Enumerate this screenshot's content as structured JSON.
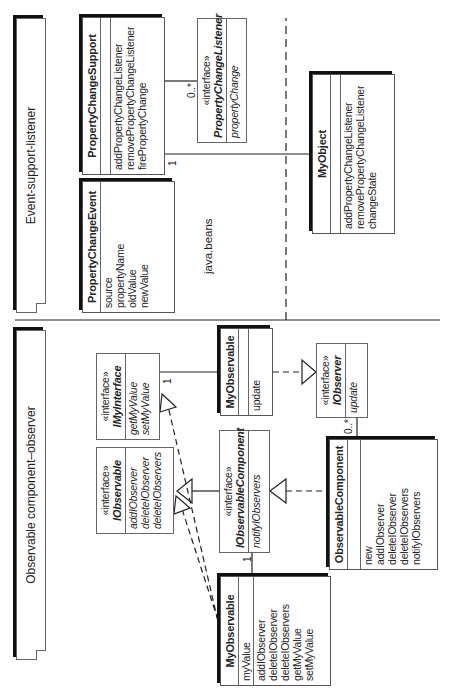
{
  "top_pattern": {
    "note_title": "Event-support-listener",
    "package_label": "java.beans",
    "classes": {
      "property_change_support": {
        "name": "PropertyChangeSupport",
        "attributes": [],
        "operations": [
          "addPropertyChangeListener",
          "removePropertyChangeListener",
          "firePropertyChange"
        ]
      },
      "property_change_event": {
        "name": "PropertyChangeEvent",
        "attributes": [
          "source",
          "propertyName",
          "oldValue",
          "newValue"
        ]
      },
      "property_change_listener": {
        "stereotype": "«interface»",
        "name": "PropertyChangeListener",
        "operations": [
          "propertyChange"
        ]
      },
      "my_object": {
        "name": "MyObject",
        "attributes": [],
        "operations": [
          "addPropertyChangeListener",
          "removePropertyChangeListener",
          "changeState"
        ]
      }
    },
    "multiplicities": {
      "support_to_listener": "0..*",
      "support_to_object": "1"
    }
  },
  "bottom_pattern": {
    "note_title": "Observable component–observer",
    "classes": {
      "i_my_interface": {
        "stereotype": "«interface»",
        "name": "IMyInterface",
        "operations": [
          "getMyValue",
          "setMyValue"
        ]
      },
      "i_observable": {
        "stereotype": "«interface»",
        "name": "IObservable",
        "operations": [
          "addIObserver",
          "deleteIObserver",
          "deleteIObservers"
        ]
      },
      "my_observable_top": {
        "name": "MyObservable",
        "attributes": [],
        "operations": [
          "update"
        ]
      },
      "i_observer": {
        "stereotype": "«interface»",
        "name": "IObserver",
        "operations": [
          "update"
        ]
      },
      "i_observable_component": {
        "stereotype": "«interface»",
        "name": "IObservableComponent",
        "operations": [
          "notifyIObservers"
        ]
      },
      "observable_component": {
        "name": "ObservableComponent",
        "attributes": [],
        "operations": [
          "new",
          "addIObserver",
          "deleteIObserver",
          "deleteIObservers",
          "notifyIObservers"
        ]
      },
      "my_observable_bottom": {
        "name": "MyObservable",
        "attributes": [
          "myValue"
        ],
        "operations": [
          "addIObserver",
          "deleteIObserver",
          "deleteIObservers",
          "getMyValue",
          "setMyValue"
        ]
      }
    },
    "multiplicities": {
      "interface_to_observable": "1",
      "component_to_observable": "1",
      "component_to_observer": "0..*"
    }
  }
}
